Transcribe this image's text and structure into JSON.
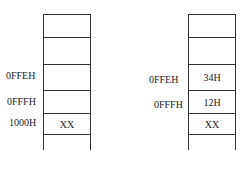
{
  "left_stack": {
    "cells": [
      "",
      "",
      "",
      "",
      "XX"
    ],
    "addresses": [
      {
        "label": "0FFEH",
        "row": 2
      },
      {
        "label": "0FFFH",
        "row": 3
      },
      {
        "label": "1000H",
        "row": 4
      }
    ]
  },
  "right_stack": {
    "cells": [
      "",
      "",
      "34H",
      "12H",
      "XX"
    ],
    "addresses": [
      {
        "label": "0FFEH",
        "row": 2
      },
      {
        "label": "0FFFH",
        "row": 3
      }
    ]
  }
}
